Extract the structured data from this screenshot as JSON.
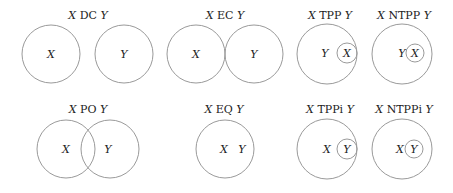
{
  "diagram": {
    "relations": [
      {
        "rel": "DC",
        "x": "X",
        "y": "Y"
      },
      {
        "rel": "EC",
        "x": "X",
        "y": "Y"
      },
      {
        "rel": "TPP",
        "x": "X",
        "y": "Y"
      },
      {
        "rel": "NTPP",
        "x": "X",
        "y": "Y"
      },
      {
        "rel": "PO",
        "x": "X",
        "y": "Y"
      },
      {
        "rel": "EQ",
        "x": "X",
        "y": "Y"
      },
      {
        "rel": "TPPi",
        "x": "X",
        "y": "Y"
      },
      {
        "rel": "NTPPi",
        "x": "X",
        "y": "Y"
      }
    ],
    "stroke_color": "#9a9a9a"
  }
}
